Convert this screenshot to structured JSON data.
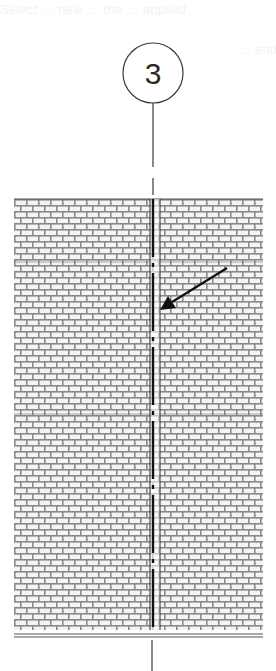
{
  "diagram": {
    "type": "architectural-elevation",
    "grid_bubble": {
      "label": "3",
      "center": [
        153,
        73
      ],
      "radius": 30
    },
    "wall": {
      "material": "brick-running-bond",
      "left": 14,
      "right": 263,
      "top": 199,
      "bottom": 630,
      "brick_width": 12,
      "course_height": 6,
      "horizontal_reference_lines_y": [
        262,
        414
      ]
    },
    "control_joint": {
      "left_line_x": 150,
      "right_line_x": 160,
      "centerline_x": 153
    },
    "leader_arrow": {
      "from": [
        227,
        268
      ],
      "to": [
        160,
        310
      ]
    },
    "ground_line": {
      "y_top": 634,
      "y_bottom": 637,
      "left": 14,
      "right": 263
    }
  },
  "ghost_text": {
    "line1": "Select … new … the … applied",
    "line2": "… end of the …",
    "line3": ""
  },
  "colors": {
    "ink": "#1e1e1e",
    "mortar": "#8a8a8a",
    "brick_face": "#f4f4f4",
    "background": "#ffffff"
  }
}
